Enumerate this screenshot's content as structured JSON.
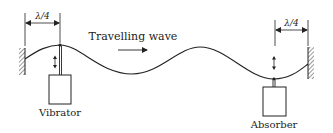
{
  "diagram": {
    "labels": {
      "wave": "Travelling wave",
      "vibrator": "Vibrator",
      "absorber": "Absorber",
      "left_dimension": "λ/4",
      "right_dimension": "λ/4"
    },
    "elements": {
      "left_wall": "fixed support (hatched)",
      "right_wall": "fixed support (hatched)",
      "string": "sinusoidal wave",
      "vibrator_motion": "vertical oscillation arrow",
      "absorber_motion": "vertical oscillation arrow",
      "wave_direction": "right"
    },
    "colors": {
      "line": "#222222",
      "background": "#ffffff"
    }
  }
}
